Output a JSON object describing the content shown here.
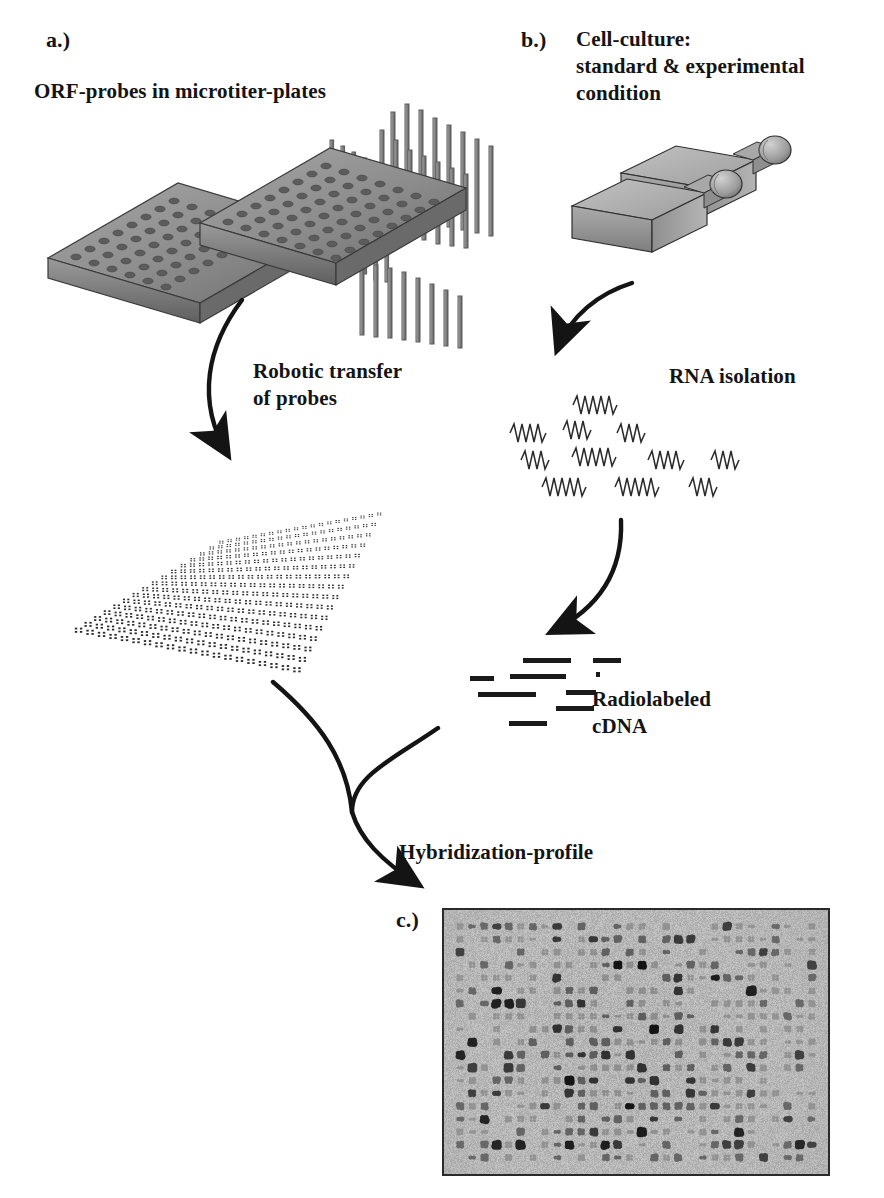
{
  "figure": {
    "background_color": "#ffffff",
    "ink_color": "#141414"
  },
  "panels": {
    "a": {
      "letter": "a.)",
      "heading": "ORF-probes in microtiter-plates",
      "process_label": "Robotic transfer\nof probes"
    },
    "b": {
      "letter": "b.)",
      "heading": "Cell-culture:\nstandard & experimental\ncondition",
      "step_label": "RNA isolation",
      "product_label": "Radiolabeled\ncDNA"
    },
    "c": {
      "letter": "c.)",
      "heading": "Hybridization-profile"
    }
  },
  "illustrations": {
    "microtiter_plates": {
      "name": "microtiter-plates",
      "count": 2,
      "wells_per_plate": 96,
      "well_rows": 8,
      "well_cols": 12,
      "top_color": "#8a8a8a",
      "side_color": "#6f6f6f",
      "edge_color": "#3a3a3a"
    },
    "pin_arrays": {
      "name": "robotic-transfer-pins",
      "groups": 3,
      "pin_color": "#9a9a9a",
      "pin_edge": "#5a5a5a"
    },
    "culture_flasks": {
      "name": "cell-culture-flasks",
      "count": 2,
      "body_color": "#9b9b9b",
      "top_color": "#bdbdbd",
      "edge_color": "#2f2f2f"
    },
    "rna_strands": {
      "name": "rna-squiggles",
      "rows": 4,
      "per_row": [
        1,
        3,
        4,
        3
      ],
      "stroke_color": "#2a2a2a"
    },
    "cdna_fragments": {
      "name": "cdna-bars",
      "count": 9,
      "color": "#1a1a1a"
    },
    "filter_membrane": {
      "name": "gridded-filter-membrane",
      "spot_rows": 16,
      "spot_cols": 20,
      "spot_color": "#2b2b2b"
    },
    "autoradiograph": {
      "name": "hybridization-autoradiograph",
      "background_color": "#b5b5b5",
      "border_color": "#2a2a2a",
      "grid_rows": 19,
      "grid_cols": 30,
      "dot_color_dark": "#1c1c1c",
      "dot_color_mid": "#6e6e6e"
    }
  },
  "arrows": {
    "plates_to_filter": "robotic transfer arrow",
    "flasks_to_rna": "rna isolation arrow",
    "rna_to_cdna": "reverse transcription arrow",
    "filter_to_hybridization": "filter converging arrow",
    "cdna_to_hybridization": "cdna converging arrow"
  }
}
